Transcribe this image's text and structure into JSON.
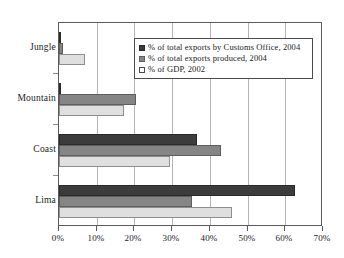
{
  "chart_data": {
    "type": "bar",
    "orientation": "horizontal",
    "title": "",
    "subtitle": "",
    "xlabel": "",
    "ylabel": "",
    "categories": [
      "Jungle",
      "Mountain",
      "Coast",
      "Lima"
    ],
    "series": [
      {
        "name": "% of total exports by Customs Office, 2004",
        "color": "#3c3c3c",
        "values": [
          0.3,
          0.5,
          36.5,
          62.5
        ]
      },
      {
        "name": "% of total exports produced, 2004",
        "color": "#858585",
        "values": [
          1.0,
          20.3,
          43.0,
          35.3
        ]
      },
      {
        "name": "% of GDP, 2002",
        "color": "#dfdfdf",
        "values": [
          7.0,
          17.2,
          29.3,
          46.0
        ]
      }
    ],
    "xlim": [
      0,
      70
    ],
    "xticks": [
      0,
      10,
      20,
      30,
      40,
      50,
      60,
      70
    ],
    "xtick_labels": [
      "0%",
      "10%",
      "20%",
      "30%",
      "40%",
      "50%",
      "60%",
      "70%"
    ],
    "grid": "vertical",
    "legend_position": "top-right-inside"
  },
  "legend": {
    "entries": [
      "% of total exports by Customs Office, 2004",
      "% of total exports produced, 2004",
      "% of GDP, 2002"
    ]
  }
}
